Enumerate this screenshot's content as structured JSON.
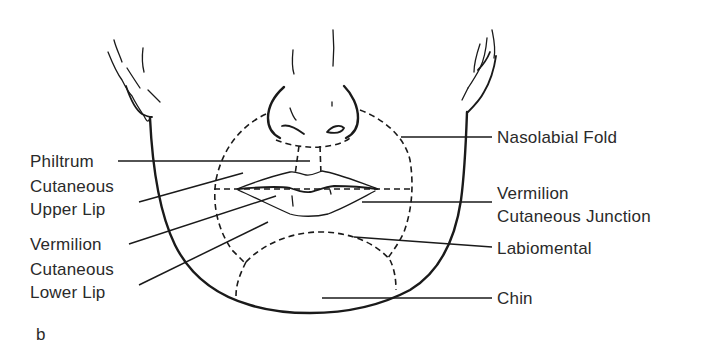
{
  "figure": {
    "panel_letter": "b",
    "background": "#ffffff",
    "ink_color": "#1a1a1a",
    "text_color": "#2a2a2a"
  },
  "labels": {
    "left": [
      {
        "id": "philtrum",
        "lines": [
          "Philtrum"
        ]
      },
      {
        "id": "cutaneous-upper-lip",
        "lines": [
          "Cutaneous",
          "Upper Lip"
        ]
      },
      {
        "id": "vermilion",
        "lines": [
          "Vermilion"
        ]
      },
      {
        "id": "cutaneous-lower-lip",
        "lines": [
          "Cutaneous",
          "Lower Lip"
        ]
      }
    ],
    "right": [
      {
        "id": "nasolabial-fold",
        "lines": [
          "Nasolabial Fold"
        ]
      },
      {
        "id": "vermilion-cutaneous-junction",
        "lines": [
          "Vermilion",
          "Cutaneous Junction"
        ]
      },
      {
        "id": "labiomental",
        "lines": [
          "Labiomental"
        ]
      },
      {
        "id": "chin",
        "lines": [
          "Chin"
        ]
      }
    ]
  }
}
